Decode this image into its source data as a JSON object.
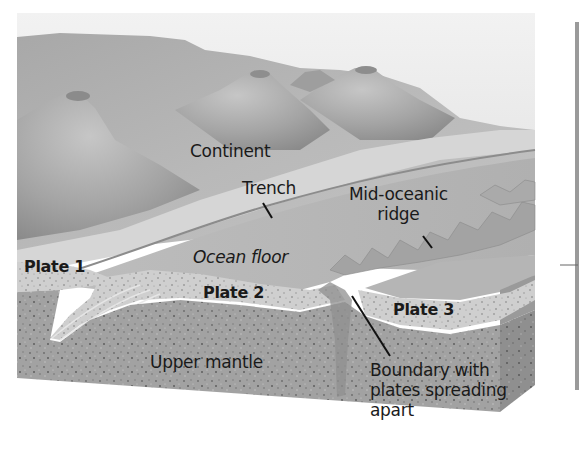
{
  "figure": {
    "type": "geologic-cross-section",
    "colors": {
      "background": "#ffffff",
      "sky": "#efefef",
      "continent_light": "#bdbdbd",
      "continent_mid": "#a9a9a9",
      "continent_dark": "#8a8a8a",
      "ocean_floor": "#c2c2c2",
      "crust": "#d0d0d0",
      "mantle": "#9d9d9d",
      "mantle_side": "#8e8e8e",
      "label_text": "#1a1a1a",
      "leader_line": "#111111"
    }
  },
  "labels": {
    "continent": "Continent",
    "trench": "Trench",
    "mid_oceanic_ridge": [
      "Mid-oceanic",
      "ridge"
    ],
    "plate_1": "Plate 1",
    "ocean_floor": "Ocean floor",
    "plate_2": "Plate 2",
    "plate_3": "Plate 3",
    "upper_mantle": "Upper mantle",
    "boundary": [
      "Boundary with",
      "plates spreading",
      "apart"
    ]
  }
}
